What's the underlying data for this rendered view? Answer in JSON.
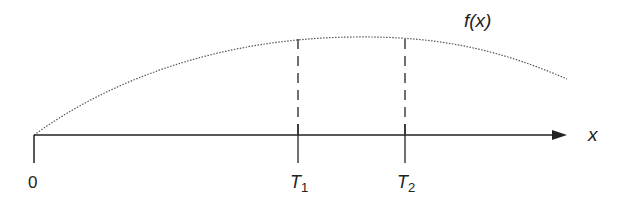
{
  "diagram": {
    "curve_label": "f(x)",
    "axis_label": "x",
    "origin_label": "0",
    "markers": [
      {
        "label": "T",
        "subscript": "1"
      },
      {
        "label": "T",
        "subscript": "2"
      }
    ]
  },
  "colors": {
    "ink": "#222222",
    "curve": "#555555",
    "background": "#ffffff"
  }
}
